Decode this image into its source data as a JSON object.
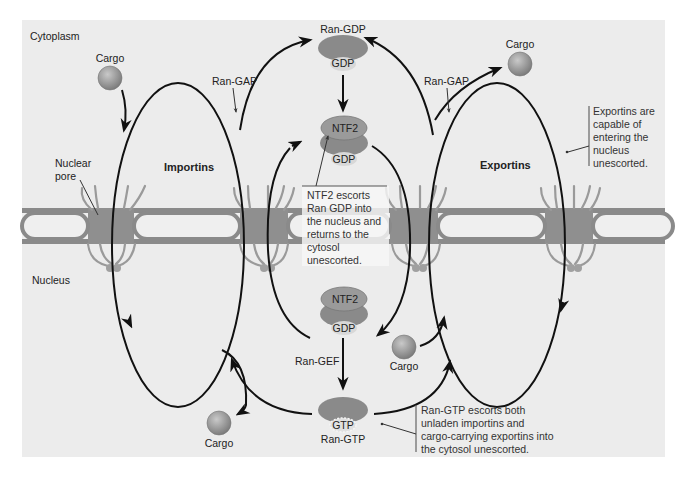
{
  "colors": {
    "panel_bg": "#ececec",
    "membrane": "#8a8a8a",
    "membrane_inner": "#f2f2f2",
    "pore_fill": "#8f8f8f",
    "pore_fibril": "#9a9a9a",
    "ran": "#8a8a8a",
    "gdp_cap": "#d8d8d8",
    "arrow": "#111111",
    "cargo": "#999999",
    "callout_box": "#f7f7f7"
  },
  "regions": {
    "cytoplasm": "Cytoplasm",
    "nucleus": "Nucleus",
    "nuclear_pore": [
      "Nuclear",
      "pore"
    ]
  },
  "cycles": {
    "importins": "Importins",
    "exportins": "Exportins"
  },
  "molecules": {
    "ran_gdp_top_label": "Ran-GDP",
    "ran_gdp_top_cap": "GDP",
    "ntf2_top": "NTF2",
    "ntf2_top_gdp": "GDP",
    "ntf2_bottom": "NTF2",
    "ntf2_bottom_gdp": "GDP",
    "ran_gtp_cap": "GTP",
    "ran_gtp_label": "Ran-GTP"
  },
  "enzymes": {
    "ran_gap_left": "Ran-GAP",
    "ran_gap_right": "Ran-GAP",
    "ran_gef": "Ran-GEF"
  },
  "cargo": {
    "top_left": "Cargo",
    "top_right": "Cargo",
    "bottom_left": "Cargo",
    "bottom_middle": "Cargo"
  },
  "callouts": {
    "ntf2": [
      "NTF2 escorts",
      "Ran GDP into",
      "the nucleus and",
      "returns to the",
      "cytosol",
      "unescorted."
    ],
    "exportins": [
      "Exportins are",
      "capable of",
      "entering the",
      "nucleus",
      "unescorted."
    ],
    "ran_gtp": [
      "Ran-GTP escorts both",
      "unladen importins and",
      "cargo-carrying exportins into",
      "the cytosol unescorted."
    ]
  }
}
